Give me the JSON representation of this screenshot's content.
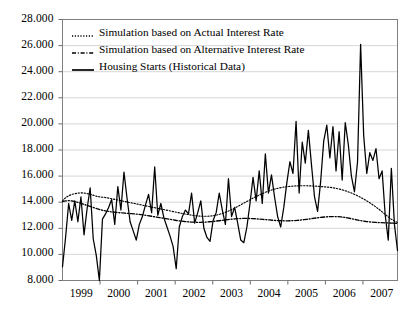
{
  "chart_data": {
    "type": "line",
    "title": "",
    "xlabel": "",
    "ylabel": "",
    "ylim": [
      8000,
      28000
    ],
    "xlim": [
      1999.0,
      2007.92
    ],
    "grid": true,
    "legend_position": "top-left",
    "y_ticks": [
      "8.000",
      "10.000",
      "12.000",
      "14.000",
      "16.000",
      "18.000",
      "20.000",
      "22.000",
      "24.000",
      "26.000",
      "28.000"
    ],
    "y_tick_values": [
      8000,
      10000,
      12000,
      14000,
      16000,
      18000,
      20000,
      22000,
      24000,
      26000,
      28000
    ],
    "x_ticks": [
      "1999",
      "2000",
      "2001",
      "2002",
      "2003",
      "2004",
      "2005",
      "2006",
      "2007"
    ],
    "x_tick_values": [
      1999,
      2000,
      2001,
      2002,
      2003,
      2004,
      2005,
      2006,
      2007
    ],
    "series": [
      {
        "name": "Simulation based on Actual Interest Rate",
        "style": "dotted",
        "color": "#000000",
        "values": [
          14100,
          14350,
          14500,
          14600,
          14650,
          14700,
          14720,
          14700,
          14650,
          14600,
          14520,
          14450,
          14400,
          14380,
          14350,
          14300,
          14250,
          14200,
          14150,
          14100,
          14050,
          14000,
          13950,
          13900,
          13850,
          13800,
          13750,
          13700,
          13650,
          13600,
          13550,
          13500,
          13450,
          13400,
          13350,
          13300,
          13250,
          13200,
          13150,
          13100,
          13060,
          13020,
          12980,
          12950,
          12930,
          12920,
          12920,
          12930,
          12960,
          13000,
          13060,
          13130,
          13220,
          13320,
          13430,
          13550,
          13680,
          13810,
          13940,
          14070,
          14200,
          14330,
          14450,
          14570,
          14680,
          14780,
          14870,
          14950,
          15020,
          15080,
          15130,
          15170,
          15200,
          15220,
          15240,
          15250,
          15260,
          15260,
          15260,
          15250,
          15240,
          15230,
          15210,
          15190,
          15170,
          15150,
          15120,
          15080,
          15030,
          14970,
          14900,
          14820,
          14730,
          14630,
          14520,
          14400,
          14270,
          14130,
          13980,
          13820,
          13650,
          13470,
          13280,
          13080,
          12880,
          12700,
          12560,
          12450
        ]
      },
      {
        "name": "Simulation based on Alternative Interest Rate",
        "style": "dashed",
        "color": "#000000",
        "values": [
          14050,
          14100,
          14120,
          14100,
          14050,
          13980,
          13900,
          13820,
          13740,
          13660,
          13580,
          13500,
          13430,
          13370,
          13320,
          13280,
          13250,
          13220,
          13200,
          13180,
          13160,
          13140,
          13120,
          13100,
          13080,
          13050,
          13020,
          12980,
          12940,
          12900,
          12860,
          12820,
          12780,
          12740,
          12700,
          12660,
          12620,
          12580,
          12550,
          12520,
          12500,
          12480,
          12470,
          12460,
          12460,
          12470,
          12480,
          12500,
          12520,
          12550,
          12580,
          12610,
          12640,
          12670,
          12700,
          12720,
          12740,
          12750,
          12760,
          12760,
          12750,
          12740,
          12720,
          12700,
          12680,
          12660,
          12640,
          12620,
          12600,
          12590,
          12580,
          12570,
          12570,
          12580,
          12590,
          12610,
          12630,
          12660,
          12690,
          12720,
          12760,
          12790,
          12820,
          12850,
          12870,
          12890,
          12900,
          12900,
          12890,
          12870,
          12840,
          12800,
          12750,
          12700,
          12650,
          12600,
          12560,
          12520,
          12490,
          12470,
          12450,
          12440,
          12430,
          12420,
          12410,
          12400,
          12390,
          12380
        ]
      },
      {
        "name": "Housing Starts (Historical Data)",
        "style": "solid",
        "color": "#000000",
        "values": [
          9050,
          11300,
          13900,
          12600,
          14100,
          12500,
          14400,
          11500,
          13500,
          15100,
          11200,
          9900,
          8000,
          12700,
          13100,
          13600,
          14200,
          12300,
          15200,
          13400,
          16300,
          14300,
          12500,
          11800,
          11100,
          12300,
          12900,
          13800,
          14600,
          13200,
          16700,
          13000,
          13900,
          12800,
          12100,
          11400,
          10600,
          8900,
          12100,
          12900,
          13400,
          13100,
          14700,
          12400,
          13200,
          14100,
          12000,
          11300,
          11000,
          12600,
          13200,
          14700,
          13400,
          12300,
          15800,
          12900,
          13600,
          12400,
          11100,
          10900,
          12100,
          13900,
          15900,
          14100,
          16400,
          13900,
          17700,
          14700,
          16100,
          14400,
          12900,
          12100,
          13600,
          15500,
          17100,
          16200,
          20200,
          14700,
          18600,
          17000,
          19500,
          16900,
          14400,
          13300,
          15600,
          18700,
          19900,
          17400,
          19800,
          16400,
          19400,
          15700,
          20100,
          18400,
          16000,
          14800,
          17100,
          26100,
          19100,
          16200,
          17800,
          17200,
          18100,
          15800,
          16400,
          13000,
          11100,
          16600,
          12300,
          10300
        ]
      }
    ]
  },
  "legend": {
    "items": [
      {
        "label": "Simulation based on Actual Interest Rate",
        "style": "dotted"
      },
      {
        "label": "Simulation based on Alternative Interest Rate",
        "style": "dashed"
      },
      {
        "label": "Housing Starts (Historical Data)",
        "style": "solid"
      }
    ]
  }
}
